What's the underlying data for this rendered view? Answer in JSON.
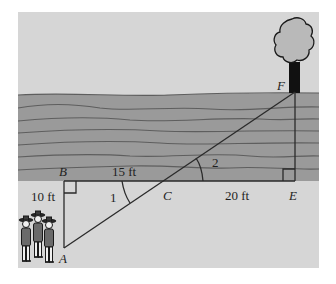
{
  "colors": {
    "page_background": "#ffffff",
    "ground": "#d6d6d6",
    "water": "#9a9a9a",
    "wave_line": "#5e5e5e",
    "line": "#2a2a2a",
    "tree_canopy": "#b9b9b9",
    "tree_trunk": "#111111",
    "text": "#1f1f1f"
  },
  "points": {
    "A": {
      "label": "A",
      "x": 64,
      "y": 248
    },
    "B": {
      "label": "B",
      "x": 64,
      "y": 181
    },
    "C": {
      "label": "C",
      "x": 163,
      "y": 181
    },
    "E": {
      "label": "E",
      "x": 295,
      "y": 181
    },
    "F": {
      "label": "F",
      "x": 295,
      "y": 92
    }
  },
  "measurements": {
    "AB": "10 ft",
    "BC": "15 ft",
    "CE": "20 ft"
  },
  "angles": {
    "angle1": "1",
    "angle2": "2"
  },
  "figures": {
    "tree": "tree",
    "people": "three scouts",
    "water": "river"
  }
}
